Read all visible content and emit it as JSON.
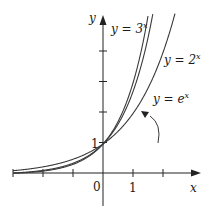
{
  "chart_data": {
    "type": "line",
    "title": "",
    "xlabel": "x",
    "ylabel": "y",
    "xlim": [
      -3,
      3
    ],
    "ylim": [
      -1,
      5.5
    ],
    "x_ticks": [
      -3,
      -2,
      -1,
      0,
      1,
      2
    ],
    "x_tick_labels": {
      "0": "0",
      "1": "1"
    },
    "y_ticks": [
      1,
      2,
      3,
      4
    ],
    "y_tick_labels": {
      "1": "1"
    },
    "grid": false,
    "series": [
      {
        "name": "y = 3^x",
        "label_text": "y = 3",
        "label_sup": "x",
        "base": 3
      },
      {
        "name": "y = e^x",
        "label_text": "y = e",
        "label_sup": "x",
        "base": 2.718281828
      },
      {
        "name": "y = 2^x",
        "label_text": "y = 2",
        "label_sup": "x",
        "base": 2
      }
    ],
    "annotations": [
      {
        "text": "y = e^x",
        "points_to": "curve y = e^x",
        "arrow": true
      }
    ],
    "common_point": {
      "x": 0,
      "y": 1
    }
  },
  "labels": {
    "origin": "0",
    "x_one": "1",
    "y_one": "1",
    "x_axis": "x",
    "y_axis": "y",
    "curve3_prefix": "y = 3",
    "curve2_prefix": "y = 2",
    "curvee_prefix": "y = e",
    "sup": "x"
  }
}
